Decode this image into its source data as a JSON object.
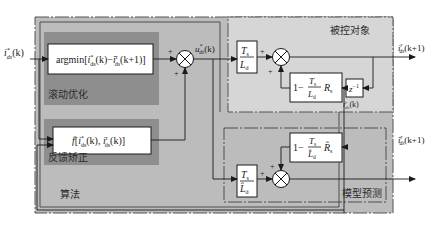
{
  "colors": {
    "outer_region": "#bcbcbc",
    "plant_region": "#d6d6d6",
    "inner_block_region": "#8e8e8e",
    "block_fill": "#ffffff",
    "line": "#1a1a1a"
  },
  "regions": {
    "algorithm": "算法",
    "rolling_optimization": "滚动优化",
    "feedback_correction": "反馈矫正",
    "plant": "被控对象",
    "model_prediction": "模型预测"
  },
  "blocks": {
    "argmin": "argmin[i*ds(k) − î^r ds(k+1)]",
    "argmin_main": "argmin[",
    "argmin_i": "i",
    "argmin_sup1": "*",
    "argmin_sub1": "ds",
    "argmin_k": "(k)−",
    "argmin_ihat": "î",
    "argmin_sup2": "r",
    "argmin_sub2": "ds",
    "argmin_tail": "(k+1)]",
    "feedback_f": "f",
    "feedback_open": "[",
    "feedback_i1": "i",
    "feedback_sup1": "*",
    "feedback_sub1": "ds",
    "feedback_k1": "(k), ",
    "feedback_i2": "i",
    "feedback_sup2": "r",
    "feedback_sub2": "ds",
    "feedback_k2": "(k)]",
    "plant_gain_num": "T",
    "plant_gain_num_sub": "s",
    "plant_gain_den": "L",
    "plant_gain_den_sub": "d",
    "plant_feedback_one": "1−",
    "plant_feedback_num": "T",
    "plant_feedback_num_sub": "s",
    "plant_feedback_den": "L",
    "plant_feedback_den_sub": "d",
    "plant_feedback_R": "R",
    "plant_feedback_R_sub": "s",
    "delay": "z",
    "delay_sup": "−1",
    "model_gain_num": "T",
    "model_gain_num_sub": "s",
    "model_gain_den": "L̂",
    "model_gain_den_sub": "d",
    "model_feedback_one": "1−",
    "model_feedback_num": "T",
    "model_feedback_num_sub": "s",
    "model_feedback_den": "L̂",
    "model_feedback_den_sub": "d",
    "model_feedback_R": "R̂",
    "model_feedback_R_sub": "s"
  },
  "signals": {
    "input_i": "i",
    "input_sup": "*",
    "input_sub": "ds",
    "input_arg": "(k)",
    "control_u": "u",
    "control_sup": "*",
    "control_sub": "ds",
    "control_arg": "(k)",
    "plant_out_i": "i",
    "plant_out_sup": "r",
    "plant_out_sub": "ds",
    "plant_out_arg": "(k+1)",
    "plant_state_i": "i",
    "plant_state_sup": "r",
    "plant_state_sub": "ds",
    "plant_state_arg": "(k)",
    "pred_out_i": "î",
    "pred_out_sup": "r",
    "pred_out_sub": "ds",
    "pred_out_arg": "(k+1)"
  },
  "signs": {
    "plus": "+"
  }
}
